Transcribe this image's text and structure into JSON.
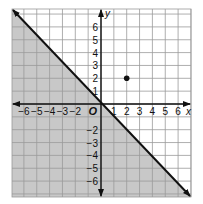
{
  "chart_data": {
    "type": "line",
    "title": "",
    "xlabel": "x",
    "ylabel": "y",
    "origin_label": "O",
    "xlim": [
      -7,
      7
    ],
    "ylim": [
      -7,
      7
    ],
    "grid": true,
    "x_ticks": [
      "-6",
      "-5",
      "-4",
      "-3",
      "-2",
      "1",
      "2",
      "3",
      "4",
      "5",
      "6"
    ],
    "y_ticks": [
      "6",
      "5",
      "4",
      "3",
      "2",
      "1",
      "-2",
      "-3",
      "-4",
      "-5",
      "-6"
    ],
    "series": [
      {
        "name": "boundary line y = -x",
        "type": "line",
        "style": "solid",
        "x": [
          -7,
          7
        ],
        "y": [
          7,
          -7
        ],
        "arrows": "both"
      },
      {
        "name": "shaded region y <= -x",
        "type": "area",
        "region": "below-left of line"
      },
      {
        "name": "point",
        "type": "scatter",
        "x": [
          2
        ],
        "y": [
          2
        ]
      }
    ],
    "colors": {
      "shade": "#c8c8c8",
      "grid": "#9a9a9a",
      "axis": "#111111",
      "line": "#111111",
      "point": "#111111"
    }
  }
}
